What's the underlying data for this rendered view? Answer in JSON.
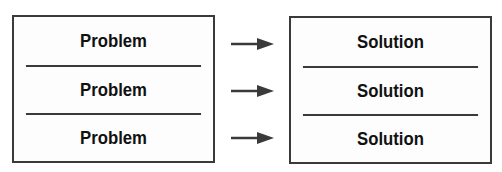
{
  "diagram": {
    "problems": [
      "Problem",
      "Problem",
      "Problem"
    ],
    "solutions": [
      "Solution",
      "Solution",
      "Solution"
    ],
    "arrow_color": "#3a3a3a",
    "border_color": "#3a3a3a"
  }
}
